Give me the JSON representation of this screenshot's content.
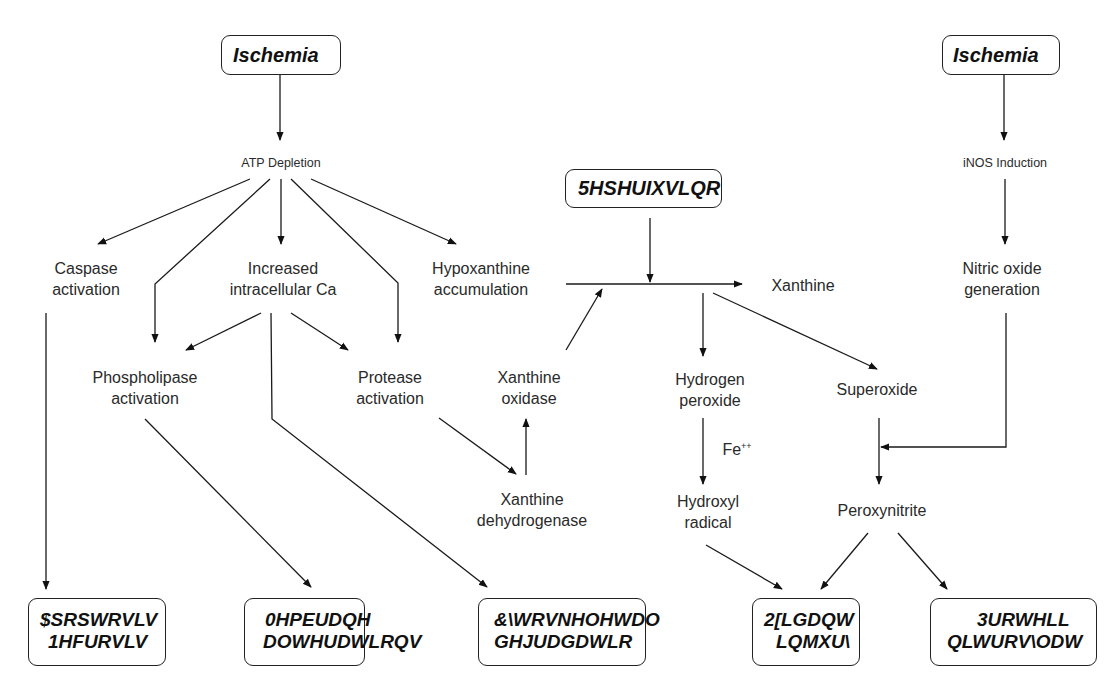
{
  "diagram": {
    "top_boxes": [
      {
        "id": "ischemia-left",
        "label": "Ischemia"
      },
      {
        "id": "reperfusion",
        "label": "5HSHUIXVLQR"
      },
      {
        "id": "ischemia-right",
        "label": "Ischemia"
      }
    ],
    "nodes": {
      "atp_depletion": "ATP Depletion",
      "inos_induction": "iNOS Induction",
      "caspase": [
        "Caspase",
        "activation"
      ],
      "increased_ca": [
        "Increased",
        "intracellular Ca"
      ],
      "hypoxanthine": [
        "Hypoxanthine",
        "accumulation"
      ],
      "xanthine": "Xanthine",
      "nitric_oxide": [
        "Nitric oxide",
        "generation"
      ],
      "phospholipase": [
        "Phospholipase",
        "activation"
      ],
      "protease": [
        "Protease",
        "activation"
      ],
      "xanthine_oxidase": [
        "Xanthine",
        "oxidase"
      ],
      "hydrogen_peroxide": [
        "Hydrogen",
        "peroxide"
      ],
      "superoxide": "Superoxide",
      "fe_label": "Fe",
      "fe_superscript": "++",
      "xanthine_dehydrogenase": [
        "Xanthine",
        "dehydrogenase"
      ],
      "hydroxyl_radical": [
        "Hydroxyl",
        "radical"
      ],
      "peroxynitrite": "Peroxynitrite"
    },
    "bottom_boxes": [
      {
        "id": "apoptosis-necrosis",
        "lines": [
          "$SRSWRVLV",
          "1HFURVLV"
        ]
      },
      {
        "id": "membrane-alterations",
        "lines": [
          "0HPEUDQH",
          "DOWHUDWLRQV"
        ]
      },
      {
        "id": "cytoskeletal-degradation",
        "lines": [
          "&\\WRVNHOHWDO",
          "GHJUDGDWLR"
        ]
      },
      {
        "id": "oxidant-injury",
        "lines": [
          "2[LGDQW",
          "LQMXU\\"
        ]
      },
      {
        "id": "protein-nitrosylation",
        "lines": [
          "3URWHLL",
          "QLWURV\\ODW"
        ]
      }
    ]
  }
}
